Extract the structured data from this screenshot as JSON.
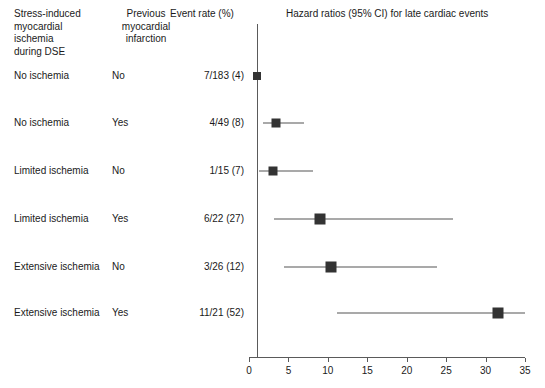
{
  "headers": {
    "group": "Stress-induced\nmyocardial\nischemia\nduring DSE",
    "previous_mi": "Previous\nmyocardial\ninfarction",
    "event_rate": "Event rate (%)",
    "plot_title": "Hazard ratios (95% CI) for late cardiac events"
  },
  "chart_data": {
    "type": "scatter",
    "title": "Hazard ratios (95% CI) for late cardiac events",
    "xlabel": "",
    "ylabel": "",
    "xlim": [
      0,
      35
    ],
    "xticks": [
      0,
      5,
      10,
      15,
      20,
      25,
      30,
      35
    ],
    "xtick_labels": [
      "0",
      "5",
      "10",
      "15",
      "20",
      "25",
      "30",
      "35"
    ],
    "grid": false,
    "reference_line": 1,
    "legend": "none",
    "categories": [
      "No ischemia / No",
      "No ischemia / Yes",
      "Limited ischemia / No",
      "Limited ischemia / Yes",
      "Extensive ischemia / No",
      "Extensive ischemia / Yes"
    ],
    "values": [
      1.0,
      3.4,
      3.0,
      9.0,
      10.4,
      31.6
    ],
    "ci_low": [
      1.0,
      1.8,
      1.3,
      3.2,
      4.4,
      11.2
    ],
    "ci_high": [
      1.0,
      7.0,
      8.1,
      25.9,
      23.8,
      35.0
    ],
    "marker_sizes": [
      8,
      9,
      9,
      11,
      11,
      11
    ]
  },
  "rows": [
    {
      "group": "No ischemia",
      "previous_mi": "No",
      "event_rate": "7/183 (4)"
    },
    {
      "group": "No ischemia",
      "previous_mi": "Yes",
      "event_rate": "4/49 (8)"
    },
    {
      "group": "Limited ischemia",
      "previous_mi": "No",
      "event_rate": "1/15 (7)"
    },
    {
      "group": "Limited ischemia",
      "previous_mi": "Yes",
      "event_rate": "6/22 (27)"
    },
    {
      "group": "Extensive ischemia",
      "previous_mi": "No",
      "event_rate": "3/26 (12)"
    },
    {
      "group": "Extensive ischemia",
      "previous_mi": "Yes",
      "event_rate": "11/21 (52)"
    }
  ],
  "colors": {
    "marker": "#333333",
    "whisker": "#555555",
    "axis": "#5a5a5a",
    "text": "#1a1a1a",
    "background": "#ffffff"
  }
}
